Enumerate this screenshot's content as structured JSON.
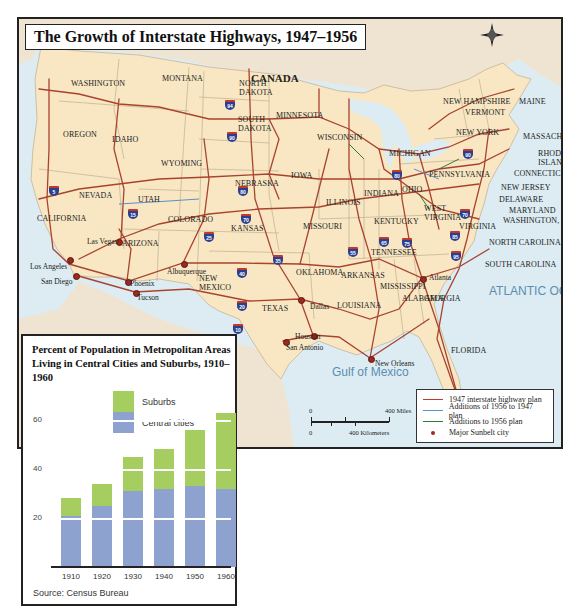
{
  "map": {
    "title": "The Growth of Interstate Highways, 1947–1956",
    "country_label": "CANADA",
    "compass": {
      "n": "N",
      "s": "S",
      "e": "E",
      "w": "W"
    },
    "oceans": {
      "pacific": "PACIFIC OCEAN",
      "atlantic": "ATLANTIC OCEAN",
      "gulf": "Gulf of Mexico"
    },
    "states": [
      {
        "name": "WASHINGTON",
        "x": 52,
        "y": 60
      },
      {
        "name": "MONTANA",
        "x": 143,
        "y": 55
      },
      {
        "name": "OREGON",
        "x": 44,
        "y": 111
      },
      {
        "name": "IDAHO",
        "x": 93,
        "y": 116
      },
      {
        "name": "WYOMING",
        "x": 142,
        "y": 140
      },
      {
        "name": "NORTH DAKOTA",
        "x": 220,
        "y": 60,
        "multiline": true
      },
      {
        "name": "SOUTH DAKOTA",
        "x": 219,
        "y": 96,
        "multiline": true
      },
      {
        "name": "MINNESOTA",
        "x": 257,
        "y": 92
      },
      {
        "name": "WISCONSIN",
        "x": 298,
        "y": 114
      },
      {
        "name": "MICHIGAN",
        "x": 370,
        "y": 130
      },
      {
        "name": "NEBRASKA",
        "x": 216,
        "y": 160
      },
      {
        "name": "IOWA",
        "x": 272,
        "y": 152
      },
      {
        "name": "NEVADA",
        "x": 60,
        "y": 172
      },
      {
        "name": "UTAH",
        "x": 119,
        "y": 176
      },
      {
        "name": "COLORADO",
        "x": 149,
        "y": 196
      },
      {
        "name": "CALIFORNIA",
        "x": 18,
        "y": 195
      },
      {
        "name": "KANSAS",
        "x": 212,
        "y": 205
      },
      {
        "name": "MISSOURI",
        "x": 284,
        "y": 203
      },
      {
        "name": "ILLINOIS",
        "x": 307,
        "y": 179
      },
      {
        "name": "INDIANA",
        "x": 345,
        "y": 170
      },
      {
        "name": "OHIO",
        "x": 383,
        "y": 166
      },
      {
        "name": "PENNSYLVANIA",
        "x": 410,
        "y": 151
      },
      {
        "name": "NEW YORK",
        "x": 437,
        "y": 109,
        "multiline": true
      },
      {
        "name": "NEW HAMPSHIRE",
        "x": 424,
        "y": 78
      },
      {
        "name": "VERMONT",
        "x": 446,
        "y": 89
      },
      {
        "name": "MAINE",
        "x": 500,
        "y": 78
      },
      {
        "name": "MASSACHUSETTS",
        "x": 504,
        "y": 113
      },
      {
        "name": "RHODE ISLAND",
        "x": 519,
        "y": 130,
        "multiline": true
      },
      {
        "name": "CONNECTICUT",
        "x": 495,
        "y": 150
      },
      {
        "name": "NEW JERSEY",
        "x": 482,
        "y": 164
      },
      {
        "name": "DELAWARE",
        "x": 480,
        "y": 176
      },
      {
        "name": "MARYLAND",
        "x": 490,
        "y": 187
      },
      {
        "name": "WASHINGTON, D.C.",
        "x": 484,
        "y": 197
      },
      {
        "name": "WEST VIRGINIA",
        "x": 405,
        "y": 185,
        "multiline": true
      },
      {
        "name": "KENTUCKY",
        "x": 355,
        "y": 198
      },
      {
        "name": "VIRGINIA",
        "x": 440,
        "y": 203
      },
      {
        "name": "NORTH CAROLINA",
        "x": 470,
        "y": 219
      },
      {
        "name": "TENNESSEE",
        "x": 352,
        "y": 229
      },
      {
        "name": "SOUTH CAROLINA",
        "x": 466,
        "y": 241
      },
      {
        "name": "ARIZONA",
        "x": 103,
        "y": 220
      },
      {
        "name": "NEW MEXICO",
        "x": 180,
        "y": 255,
        "multiline": true
      },
      {
        "name": "OKLAHOMA",
        "x": 277,
        "y": 249
      },
      {
        "name": "ARKANSAS",
        "x": 322,
        "y": 252
      },
      {
        "name": "MISSISSIPPI",
        "x": 361,
        "y": 263
      },
      {
        "name": "ALABAMA",
        "x": 383,
        "y": 275
      },
      {
        "name": "GEORGIA",
        "x": 405,
        "y": 275
      },
      {
        "name": "TEXAS",
        "x": 243,
        "y": 285
      },
      {
        "name": "LOUISIANA",
        "x": 318,
        "y": 282
      },
      {
        "name": "FLORIDA",
        "x": 432,
        "y": 327
      }
    ],
    "cities": [
      {
        "name": "Las Vegas",
        "x": 68,
        "y": 218,
        "dot_x": 99,
        "dot_y": 222
      },
      {
        "name": "Los Angeles",
        "x": 11,
        "y": 243,
        "dot_x": 50,
        "dot_y": 240
      },
      {
        "name": "San Diego",
        "x": 22,
        "y": 258,
        "dot_x": 56,
        "dot_y": 256
      },
      {
        "name": "Albuquerque",
        "x": 148,
        "y": 248,
        "dot_x": 164,
        "dot_y": 244
      },
      {
        "name": "Phoenix",
        "x": 111,
        "y": 260,
        "dot_x": 108,
        "dot_y": 262
      },
      {
        "name": "Tucson",
        "x": 118,
        "y": 274,
        "dot_x": 116,
        "dot_y": 273
      },
      {
        "name": "Dallas",
        "x": 291,
        "y": 283,
        "dot_x": 281,
        "dot_y": 280
      },
      {
        "name": "Houston",
        "x": 276,
        "y": 313,
        "dot_x": 294,
        "dot_y": 316
      },
      {
        "name": "San Antonio",
        "x": 267,
        "y": 324,
        "dot_x": 266,
        "dot_y": 322
      },
      {
        "name": "New Orleans",
        "x": 356,
        "y": 340,
        "dot_x": 351,
        "dot_y": 339
      },
      {
        "name": "Atlanta",
        "x": 410,
        "y": 254,
        "dot_x": 403,
        "dot_y": 259
      },
      {
        "name": "Miami",
        "x": 444,
        "y": 382,
        "dot_x": 441,
        "dot_y": 385
      }
    ],
    "interstate_shields": [
      {
        "number": "5",
        "x": 30,
        "y": 167
      },
      {
        "number": "15",
        "x": 109,
        "y": 190
      },
      {
        "number": "94",
        "x": 206,
        "y": 81
      },
      {
        "number": "90",
        "x": 208,
        "y": 113
      },
      {
        "number": "80",
        "x": 219,
        "y": 167
      },
      {
        "number": "70",
        "x": 222,
        "y": 195
      },
      {
        "number": "25",
        "x": 185,
        "y": 213
      },
      {
        "number": "35",
        "x": 254,
        "y": 236
      },
      {
        "number": "40",
        "x": 218,
        "y": 249
      },
      {
        "number": "20",
        "x": 218,
        "y": 282
      },
      {
        "number": "10",
        "x": 214,
        "y": 305
      },
      {
        "number": "55",
        "x": 329,
        "y": 228
      },
      {
        "number": "65",
        "x": 360,
        "y": 218
      },
      {
        "number": "75",
        "x": 383,
        "y": 219
      },
      {
        "number": "85",
        "x": 431,
        "y": 212
      },
      {
        "number": "95",
        "x": 432,
        "y": 232
      },
      {
        "number": "80",
        "x": 373,
        "y": 151
      },
      {
        "number": "90",
        "x": 444,
        "y": 130
      },
      {
        "number": "70",
        "x": 441,
        "y": 190
      }
    ],
    "legend": {
      "items": [
        {
          "label": "1947 interstate highway plan",
          "color": "#c0392b",
          "kind": "line"
        },
        {
          "label": "Additions of 1956 to 1947 plan",
          "color": "#5b8fc9",
          "kind": "line"
        },
        {
          "label": "Additions to 1956 plan",
          "color": "#2e7d32",
          "kind": "line"
        },
        {
          "label": "Major Sunbelt city",
          "color": "#9c2a20",
          "kind": "dot"
        }
      ]
    },
    "scale": {
      "miles_zero": "0",
      "miles_label": "400 Miles",
      "km_zero": "0",
      "km_label": "400 Kilometers"
    },
    "colors": {
      "land_us": "#f8e7c2",
      "land_other": "#efe4d2",
      "water": "#dcecf2",
      "highway": "#a9432f",
      "border": "#b7a68a"
    }
  },
  "chart": {
    "title": "Percent of Population in Metropolitan Areas Living in Central Cities and Suburbs, 1910–1960",
    "legend": {
      "suburbs": "Suburbs",
      "central": "Central cities"
    },
    "source": "Source: Census Bureau",
    "y_ticks": [
      "20",
      "40",
      "60"
    ]
  },
  "chart_data": {
    "type": "bar",
    "stacked": true,
    "title": "Percent of Population in Metropolitan Areas Living in Central Cities and Suburbs, 1910–1960",
    "categories": [
      "1910",
      "1920",
      "1930",
      "1940",
      "1950",
      "1960"
    ],
    "series": [
      {
        "name": "Central cities",
        "color": "#8ea2cf",
        "values": [
          21,
          25,
          31,
          32,
          33,
          32
        ]
      },
      {
        "name": "Suburbs",
        "color": "#a6cd5f",
        "values": [
          7,
          9,
          14,
          16,
          23,
          31
        ]
      }
    ],
    "totals": [
      28,
      34,
      45,
      48,
      56,
      63
    ],
    "xlabel": "",
    "ylabel": "",
    "y_ticks": [
      20,
      40,
      60
    ],
    "ylim": [
      0,
      70
    ],
    "grid": "white horizontal lines at 20, 40, 60",
    "legend_position": "top",
    "source": "Source: Census Bureau"
  }
}
